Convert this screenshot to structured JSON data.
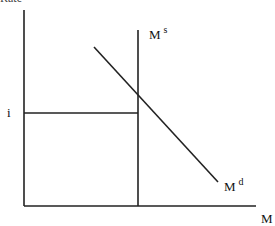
{
  "diagram": {
    "title_fragment": "Rate",
    "y_label": "i",
    "x_label": "M",
    "supply_label": {
      "base": "M",
      "sup": "s"
    },
    "demand_label": {
      "base": "M",
      "sup": "d"
    },
    "line_color": "#222222"
  }
}
